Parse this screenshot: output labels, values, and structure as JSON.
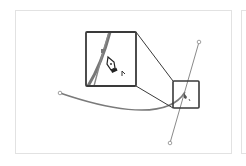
{
  "diagram": {
    "colors": {
      "curve": "#7a7a7a",
      "handle_line": "#888888",
      "callout_border": "#3a3a3a",
      "panel_border": "#e2e2e2"
    },
    "elements": [
      {
        "name": "bezier-curve",
        "type": "path"
      },
      {
        "name": "direction-handle",
        "type": "line"
      },
      {
        "name": "anchor-start",
        "type": "point"
      },
      {
        "name": "handle-top",
        "type": "point"
      },
      {
        "name": "handle-bottom",
        "type": "point"
      },
      {
        "name": "small-focus-box",
        "type": "rect"
      },
      {
        "name": "magnified-callout",
        "type": "rect"
      },
      {
        "name": "pen-tool-cursor",
        "type": "icon"
      }
    ]
  }
}
